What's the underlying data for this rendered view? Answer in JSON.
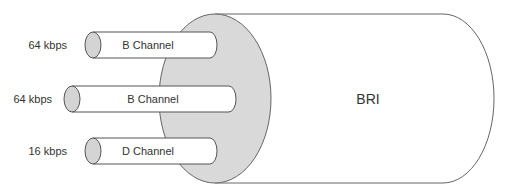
{
  "diagram": {
    "title": "BRI",
    "channels": [
      {
        "name": "B Channel",
        "rate": "64 kbps"
      },
      {
        "name": "B Channel",
        "rate": "64 kbps"
      },
      {
        "name": "D Channel",
        "rate": "16 kbps"
      }
    ],
    "colors": {
      "stroke": "#555555",
      "fill_gray": "#d9d9d9",
      "fill_white": "#ffffff"
    }
  }
}
